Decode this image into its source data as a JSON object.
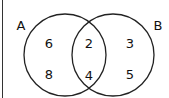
{
  "diagram": {
    "type": "venn",
    "sets": [
      {
        "name": "A",
        "label_pos": [
          22,
          24
        ]
      },
      {
        "name": "B",
        "label_pos": [
          158,
          24
        ]
      }
    ],
    "regions": {
      "A_only": [
        "6",
        "8"
      ],
      "A_and_B": [
        "2",
        "4"
      ],
      "B_only": [
        "3",
        "5"
      ]
    },
    "labels": {
      "A": "A",
      "B": "B",
      "a1": "6",
      "a2": "8",
      "ab1": "2",
      "ab2": "4",
      "b1": "3",
      "b2": "5"
    },
    "stroke_color": "#222222"
  }
}
